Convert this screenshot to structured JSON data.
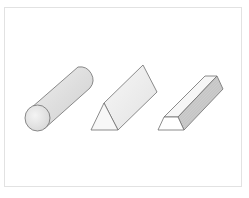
{
  "diagram": {
    "title": "",
    "shapes": [
      {
        "name": "cylinder",
        "label": ""
      },
      {
        "name": "triangular-prism",
        "label": ""
      },
      {
        "name": "trapezoidal-prism",
        "label": ""
      }
    ],
    "colors": {
      "stroke": "#6e6e6e",
      "face_light": "#f2f2f2",
      "face_mid": "#e0e0e0",
      "face_dark": "#c8c8c8",
      "frame_border": "#e2e2e2"
    }
  }
}
